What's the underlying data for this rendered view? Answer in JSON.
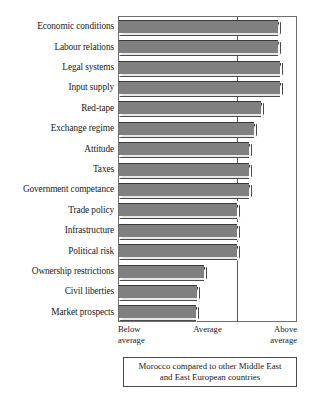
{
  "chart_data": {
    "type": "bar",
    "orientation": "horizontal",
    "title": "",
    "subtitle": "",
    "xlabel": "",
    "ylabel": "",
    "grid": false,
    "legend": "none",
    "caption": "Morocco compared to other Middle East and East European countries",
    "caption_lines": [
      "Morocco compared to other Middle East",
      "and East European countries"
    ],
    "axis_tick_labels": [
      {
        "id": "below-average",
        "lines": [
          "Below",
          "average"
        ],
        "position": "left",
        "value": 0
      },
      {
        "id": "average",
        "lines": [
          "Average"
        ],
        "position": "center",
        "value": 1
      },
      {
        "id": "above-average",
        "lines": [
          "Above",
          "average"
        ],
        "position": "right",
        "value": 2
      }
    ],
    "xlim": [
      0,
      1.5
    ],
    "xtick_values": [
      0,
      1,
      1.5
    ],
    "categories": [
      "Economic conditions",
      "Labour relations",
      "Legal systems",
      "Input supply",
      "Red-tape",
      "Exchange regime",
      "Attitude",
      "Taxes",
      "Government competance",
      "Trade policy",
      "Infrastructure",
      "Political risk",
      "Ownership restrictions",
      "Civil liberties",
      "Market prospects"
    ],
    "values": [
      1.36,
      1.36,
      1.37,
      1.37,
      1.21,
      1.15,
      1.11,
      1.11,
      1.11,
      1.01,
      1.01,
      1.01,
      0.73,
      0.67,
      0.66
    ],
    "series": [
      {
        "name": "Morocco rating",
        "values": [
          1.36,
          1.36,
          1.37,
          1.37,
          1.21,
          1.15,
          1.11,
          1.11,
          1.11,
          1.01,
          1.01,
          1.01,
          0.73,
          0.67,
          0.66
        ]
      }
    ],
    "colors": {
      "bar_fill": "#808080",
      "bar_edge": "#3a3a3a",
      "bar_bevel_light": "#e8e8e8",
      "plot_border": "#6e6e6e",
      "gridline": "#5a5a5a",
      "text": "#1a1a1a",
      "background": "#ffffff"
    }
  }
}
